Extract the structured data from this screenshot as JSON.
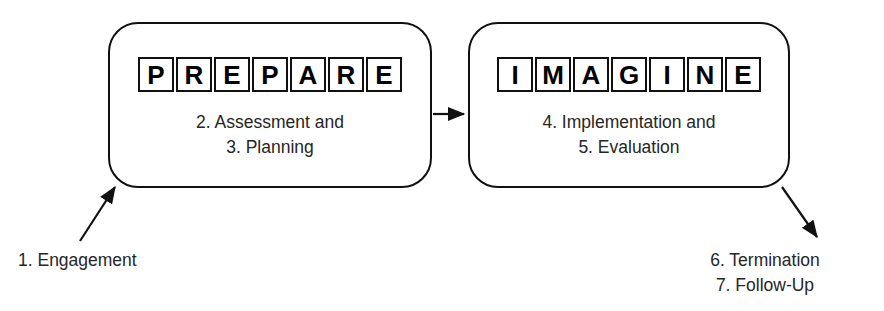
{
  "diagram": {
    "background_color": "#ffffff",
    "line_color": "#111111",
    "text_color": "#262626"
  },
  "stages": [
    {
      "id": "prepare",
      "acronym": "PREPARE",
      "letters": [
        "P",
        "R",
        "E",
        "P",
        "A",
        "R",
        "E"
      ],
      "lines": [
        "2. Assessment and",
        "3. Planning"
      ]
    },
    {
      "id": "imagine",
      "acronym": "IMAGINE",
      "letters": [
        "I",
        "M",
        "A",
        "G",
        "I",
        "N",
        "E"
      ],
      "lines": [
        "4. Implementation and",
        "5. Evaluation"
      ]
    }
  ],
  "captions": {
    "inbound": {
      "lines": [
        "1. Engagement"
      ]
    },
    "outbound": {
      "lines": [
        "6. Termination",
        "7. Follow-Up"
      ]
    }
  },
  "connectors": [
    {
      "id": "prepare-to-imagine",
      "from": "prepare",
      "to": "imagine",
      "direction": "right"
    },
    {
      "id": "engagement-into-prepare",
      "from": "1. Engagement",
      "to": "prepare",
      "direction": "up-right"
    },
    {
      "id": "imagine-to-termination",
      "from": "imagine",
      "to": "6. Termination",
      "direction": "down-right"
    }
  ]
}
